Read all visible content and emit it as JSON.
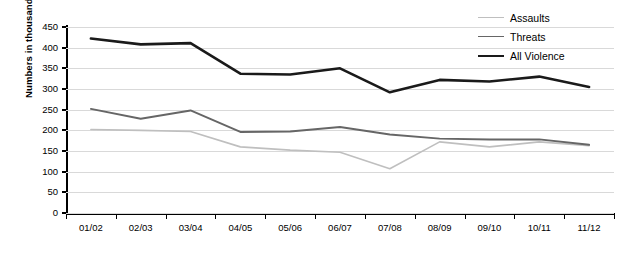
{
  "chart_data": {
    "type": "line",
    "title": "",
    "xlabel": "",
    "ylabel": "Numbers in thousands",
    "ylim": [
      0,
      450
    ],
    "ytick_step": 50,
    "yticks": [
      450,
      400,
      350,
      300,
      250,
      200,
      150,
      100,
      50,
      0
    ],
    "grid": true,
    "legend_position": "top-right",
    "categories": [
      "01/02",
      "02/03",
      "03/04",
      "04/05",
      "05/06",
      "06/07",
      "07/08",
      "08/09",
      "09/10",
      "10/11",
      "11/12"
    ],
    "series": [
      {
        "name": "Assaults",
        "color": "#bfbfbf",
        "values": [
          202,
          200,
          197,
          160,
          152,
          147,
          107,
          172,
          160,
          172,
          163
        ]
      },
      {
        "name": "Threats",
        "color": "#666666",
        "values": [
          252,
          228,
          248,
          196,
          197,
          208,
          190,
          180,
          178,
          178,
          165
        ]
      },
      {
        "name": "All Violence",
        "color": "#1a1a1a",
        "values": [
          422,
          408,
          411,
          337,
          335,
          350,
          292,
          322,
          318,
          330,
          305
        ]
      }
    ]
  },
  "legend": {
    "items": [
      {
        "label": "Assaults"
      },
      {
        "label": "Threats"
      },
      {
        "label": "All Violence"
      }
    ]
  }
}
